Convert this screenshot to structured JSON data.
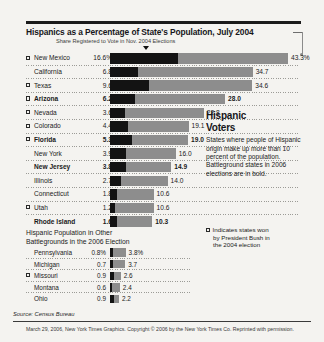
{
  "header": {
    "title": "Hispanics as a Percentage of State's Population, July 2004",
    "subtitle": "Share Registered to Vote in Nov. 2004 Elections"
  },
  "sidebar": {
    "title_line1": "Hispanic",
    "title_line2": "Voters",
    "body": "States where people of Hispanic origin make up more than 10 percent of the population. Battleground states in 2006 elections are in bold.",
    "legend_line1": "Indicates states won",
    "legend_line2": "by President Bush in",
    "legend_line3": "the 2004 election"
  },
  "panel2": {
    "title_line1": "Hispanic Population in Other",
    "title_line2": "Battlegrounds in the 2006 Election"
  },
  "footer": {
    "source": "Source: Census Bureau",
    "credit": "March 29, 2006, New York Times Graphics. Copyright © 2006 by the New York Times Co. Reprinted with permission."
  },
  "chart_data": {
    "type": "bar",
    "title": "Hispanics as a Percentage of State's Population, July 2004",
    "subtitle": "Share Registered to Vote in Nov. 2004 Elections",
    "xlabel": "",
    "ylabel": "",
    "xlim": [
      0,
      43.3
    ],
    "grid": false,
    "legend": [
      "Share registered to vote (black)",
      "Hispanic percentage of population (gray)"
    ],
    "series": [
      {
        "name": "Share Registered to Vote",
        "values": [
          16.6,
          6.8,
          9.6,
          6.2,
          3.6,
          4.4,
          5.3,
          3.9,
          3.8,
          2.7,
          1.8,
          1.2,
          1.6
        ]
      },
      {
        "name": "Hispanic Percentage of Population",
        "values": [
          43.3,
          34.7,
          34.6,
          28.0,
          22.8,
          19.1,
          19.0,
          16.0,
          14.9,
          14.0,
          10.6,
          10.6,
          10.3
        ]
      }
    ],
    "categories": [
      "New Mexico",
      "California",
      "Texas",
      "Arizona",
      "Nevada",
      "Colorado",
      "Florida",
      "New York",
      "New Jersey",
      "Illinois",
      "Connecticut",
      "Utah",
      "Rhode Island"
    ],
    "rows": [
      {
        "state": "New Mexico",
        "share": "16.6%",
        "total": "43.3%",
        "share_val": 16.6,
        "total_val": 43.3,
        "bush": true,
        "bold": false
      },
      {
        "state": "California",
        "share": "6.8",
        "total": "34.7",
        "share_val": 6.8,
        "total_val": 34.7,
        "bush": false,
        "bold": false
      },
      {
        "state": "Texas",
        "share": "9.6",
        "total": "34.6",
        "share_val": 9.6,
        "total_val": 34.6,
        "bush": true,
        "bold": false
      },
      {
        "state": "Arizona",
        "share": "6.2",
        "total": "28.0",
        "share_val": 6.2,
        "total_val": 28.0,
        "bush": true,
        "bold": true
      },
      {
        "state": "Nevada",
        "share": "3.6",
        "total": "22.8",
        "share_val": 3.6,
        "total_val": 22.8,
        "bush": true,
        "bold": false
      },
      {
        "state": "Colorado",
        "share": "4.4",
        "total": "19.1",
        "share_val": 4.4,
        "total_val": 19.1,
        "bush": true,
        "bold": false
      },
      {
        "state": "Florida",
        "share": "5.3",
        "total": "19.0",
        "share_val": 5.3,
        "total_val": 19.0,
        "bush": true,
        "bold": true
      },
      {
        "state": "New York",
        "share": "3.9",
        "total": "16.0",
        "share_val": 3.9,
        "total_val": 16.0,
        "bush": false,
        "bold": false
      },
      {
        "state": "New Jersey",
        "share": "3.8",
        "total": "14.9",
        "share_val": 3.8,
        "total_val": 14.9,
        "bush": false,
        "bold": true
      },
      {
        "state": "Illinois",
        "share": "2.7",
        "total": "14.0",
        "share_val": 2.7,
        "total_val": 14.0,
        "bush": false,
        "bold": false
      },
      {
        "state": "Connecticut",
        "share": "1.8",
        "total": "10.6",
        "share_val": 1.8,
        "total_val": 10.6,
        "bush": false,
        "bold": false
      },
      {
        "state": "Utah",
        "share": "1.2",
        "total": "10.6",
        "share_val": 1.2,
        "total_val": 10.6,
        "bush": true,
        "bold": false
      },
      {
        "state": "Rhode Island",
        "share": "1.6",
        "total": "10.3",
        "share_val": 1.6,
        "total_val": 10.3,
        "bush": false,
        "bold": true
      }
    ]
  },
  "chart_data_2": {
    "type": "bar",
    "title": "Hispanic Population in Other Battlegrounds in the 2006 Election",
    "xlim": [
      0,
      43.3
    ],
    "grid": false,
    "categories": [
      "Pennsylvania",
      "Michigan",
      "Missouri",
      "Montana",
      "Ohio"
    ],
    "series": [
      {
        "name": "Share Registered to Vote",
        "values": [
          0.8,
          0.7,
          0.9,
          0.6,
          0.9
        ]
      },
      {
        "name": "Hispanic Percentage of Population",
        "values": [
          3.8,
          3.7,
          2.6,
          2.4,
          2.2
        ]
      }
    ],
    "rows": [
      {
        "state": "Pennsylvania",
        "share": "0.8%",
        "total": "3.8%",
        "share_val": 0.8,
        "total_val": 3.8,
        "bush": false
      },
      {
        "state": "Michigan",
        "share": "0.7",
        "total": "3.7",
        "share_val": 0.7,
        "total_val": 3.7,
        "bush": false
      },
      {
        "state": "Missouri",
        "share": "0.9",
        "total": "2.6",
        "share_val": 0.9,
        "total_val": 2.6,
        "bush": true
      },
      {
        "state": "Montana",
        "share": "0.6",
        "total": "2.4",
        "share_val": 0.6,
        "total_val": 2.4,
        "bush": false
      },
      {
        "state": "Ohio",
        "share": "0.9",
        "total": "2.2",
        "share_val": 0.9,
        "total_val": 2.2,
        "bush": false
      }
    ]
  }
}
